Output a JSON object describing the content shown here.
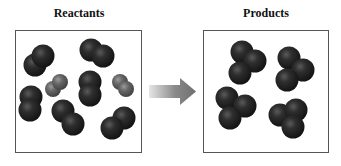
{
  "title_left": "Reactants",
  "title_right": "Products",
  "colors": {
    "dark_atom": "#1c1c1c",
    "dark_atom_highlight": "#5a5a5a",
    "light_atom": "#5e5e5e",
    "light_atom_highlight": "#9a9a9a",
    "box_border": "#555555",
    "arrow": "#7a7a7a"
  },
  "reactants": {
    "molecules": [
      {
        "type": "dark-diatomic",
        "atoms": [
          [
            35,
            65
          ],
          [
            43,
            56
          ]
        ]
      },
      {
        "type": "dark-diatomic",
        "atoms": [
          [
            91,
            50
          ],
          [
            103,
            56
          ]
        ]
      },
      {
        "type": "gray-diatomic",
        "atoms": [
          [
            53,
            89
          ],
          [
            60,
            82
          ]
        ]
      },
      {
        "type": "dark-diatomic",
        "atoms": [
          [
            90,
            82
          ],
          [
            90,
            95
          ]
        ]
      },
      {
        "type": "gray-diatomic",
        "atoms": [
          [
            120,
            82
          ],
          [
            126,
            89
          ]
        ]
      },
      {
        "type": "dark-diatomic",
        "atoms": [
          [
            31,
            97
          ],
          [
            30,
            110
          ]
        ]
      },
      {
        "type": "dark-diatomic",
        "atoms": [
          [
            63,
            111
          ],
          [
            73,
            124
          ]
        ]
      },
      {
        "type": "dark-diatomic",
        "atoms": [
          [
            124,
            118
          ],
          [
            112,
            128
          ]
        ]
      }
    ]
  },
  "products": {
    "molecules": [
      {
        "type": "dark-triatomic",
        "atoms": [
          [
            242,
            52
          ],
          [
            255,
            61
          ],
          [
            240,
            73
          ]
        ]
      },
      {
        "type": "dark-triatomic",
        "atoms": [
          [
            289,
            58
          ],
          [
            303,
            70
          ],
          [
            287,
            80
          ]
        ]
      },
      {
        "type": "dark-triatomic",
        "atoms": [
          [
            227,
            98
          ],
          [
            245,
            106
          ],
          [
            230,
            118
          ]
        ]
      },
      {
        "type": "dark-triatomic",
        "atoms": [
          [
            280,
            115
          ],
          [
            296,
            110
          ],
          [
            293,
            127
          ]
        ]
      }
    ]
  }
}
